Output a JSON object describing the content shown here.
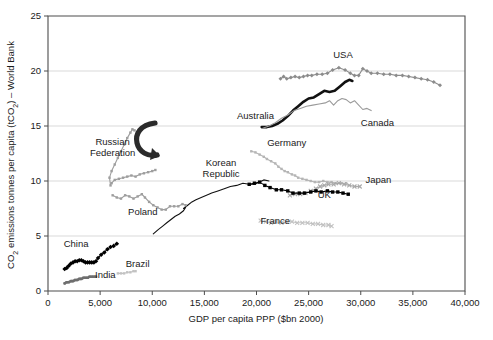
{
  "chart_data": {
    "type": "line",
    "title": "",
    "xlabel": "GDP per capita PPP ($bn 2000)",
    "ylabel": "CO₂ emissions tonnes per capita (tCO₂) – World Bank",
    "xlim": [
      0,
      40000
    ],
    "ylim": [
      0,
      25
    ],
    "xticks": [
      0,
      5000,
      10000,
      15000,
      20000,
      25000,
      30000,
      35000,
      40000
    ],
    "xtick_labels": [
      "0",
      "5,000",
      "10,000",
      "15,000",
      "20,000",
      "25,000",
      "30,000",
      "35,000",
      "40,000"
    ],
    "yticks": [
      0,
      5,
      10,
      15,
      20,
      25
    ],
    "ytick_labels": [
      "0",
      "5",
      "10",
      "15",
      "20",
      "25"
    ],
    "grid": "horizontal",
    "legend_position": "inline-annotations",
    "annotations": [
      {
        "text": "USA",
        "x": 28300,
        "y": 21.2
      },
      {
        "text": "Australia",
        "x": 19900,
        "y": 15.6
      },
      {
        "text": "Canada",
        "x": 31600,
        "y": 15.0
      },
      {
        "text": "Russian\nFederation",
        "x": 6200,
        "y": 13.3
      },
      {
        "text": "Germany",
        "x": 22900,
        "y": 13.2
      },
      {
        "text": "Korean\nRepublic",
        "x": 16600,
        "y": 11.4
      },
      {
        "text": "Japan",
        "x": 31700,
        "y": 9.8
      },
      {
        "text": "UK",
        "x": 26500,
        "y": 8.5
      },
      {
        "text": "Poland",
        "x": 9100,
        "y": 6.9
      },
      {
        "text": "France",
        "x": 21800,
        "y": 6.1
      },
      {
        "text": "China",
        "x": 2700,
        "y": 4.0
      },
      {
        "text": "Brazil",
        "x": 8600,
        "y": 2.2
      },
      {
        "text": "India",
        "x": 5500,
        "y": 1.2
      }
    ],
    "arrow_annotation": {
      "name": "curved-arrow-russian-federation",
      "x": 9400,
      "y": 13.0
    },
    "series": [
      {
        "name": "USA",
        "color": "#8c8c8c",
        "marker": "diamond",
        "style": "line-marker",
        "points": [
          [
            22300,
            19.3
          ],
          [
            22600,
            19.5
          ],
          [
            22900,
            19.3
          ],
          [
            23300,
            19.4
          ],
          [
            23700,
            19.5
          ],
          [
            24100,
            19.4
          ],
          [
            24500,
            19.5
          ],
          [
            24900,
            19.6
          ],
          [
            25300,
            19.6
          ],
          [
            25800,
            19.7
          ],
          [
            26300,
            19.7
          ],
          [
            26800,
            19.8
          ],
          [
            27300,
            20.1
          ],
          [
            27900,
            20.3
          ],
          [
            28500,
            20.1
          ],
          [
            29000,
            19.8
          ],
          [
            29400,
            19.6
          ],
          [
            29800,
            19.6
          ],
          [
            30200,
            20.2
          ],
          [
            30600,
            20.0
          ],
          [
            31000,
            19.8
          ],
          [
            31600,
            19.8
          ],
          [
            32200,
            19.7
          ],
          [
            32800,
            19.7
          ],
          [
            33400,
            19.6
          ],
          [
            34000,
            19.6
          ],
          [
            34600,
            19.5
          ],
          [
            35200,
            19.4
          ],
          [
            35800,
            19.3
          ],
          [
            36400,
            19.2
          ],
          [
            37000,
            19.0
          ],
          [
            37600,
            18.7
          ]
        ]
      },
      {
        "name": "Australia",
        "color": "#111111",
        "marker": "none",
        "style": "thick-line",
        "points": [
          [
            20500,
            14.9
          ],
          [
            21000,
            14.9
          ],
          [
            21500,
            15.0
          ],
          [
            22000,
            15.2
          ],
          [
            22500,
            15.5
          ],
          [
            23000,
            15.9
          ],
          [
            23500,
            16.4
          ],
          [
            24000,
            16.8
          ],
          [
            24500,
            17.2
          ],
          [
            25000,
            17.5
          ],
          [
            25500,
            17.6
          ],
          [
            26000,
            17.9
          ],
          [
            26500,
            18.2
          ],
          [
            27000,
            18.1
          ],
          [
            27500,
            18.2
          ],
          [
            28000,
            18.6
          ],
          [
            28500,
            19.0
          ],
          [
            28900,
            19.2
          ],
          [
            29200,
            19.1
          ]
        ]
      },
      {
        "name": "Canada",
        "color": "#9a9a9a",
        "marker": "none",
        "style": "line",
        "points": [
          [
            20600,
            14.8
          ],
          [
            21200,
            15.0
          ],
          [
            21800,
            15.3
          ],
          [
            22400,
            15.7
          ],
          [
            23000,
            16.0
          ],
          [
            23600,
            16.4
          ],
          [
            24200,
            16.6
          ],
          [
            24800,
            16.8
          ],
          [
            25400,
            16.9
          ],
          [
            26000,
            17.0
          ],
          [
            26600,
            17.1
          ],
          [
            27000,
            17.3
          ],
          [
            27400,
            16.9
          ],
          [
            27800,
            17.3
          ],
          [
            28200,
            17.5
          ],
          [
            28600,
            17.4
          ],
          [
            29000,
            17.1
          ],
          [
            29400,
            17.3
          ],
          [
            29800,
            16.9
          ],
          [
            30200,
            16.5
          ],
          [
            30600,
            16.6
          ],
          [
            31000,
            16.4
          ]
        ]
      },
      {
        "name": "Germany",
        "color": "#b5b5b5",
        "marker": "square",
        "style": "line-marker",
        "points": [
          [
            19500,
            12.7
          ],
          [
            19900,
            12.6
          ],
          [
            20300,
            12.4
          ],
          [
            20700,
            12.2
          ],
          [
            21000,
            12.0
          ],
          [
            21400,
            11.8
          ],
          [
            21800,
            11.6
          ],
          [
            22100,
            11.3
          ],
          [
            22400,
            11.1
          ],
          [
            22700,
            10.9
          ],
          [
            23000,
            10.8
          ],
          [
            23400,
            10.6
          ],
          [
            23700,
            10.5
          ],
          [
            24000,
            10.3
          ],
          [
            24400,
            10.2
          ],
          [
            24800,
            10.1
          ],
          [
            25200,
            10.0
          ],
          [
            25600,
            9.9
          ],
          [
            26000,
            9.9
          ],
          [
            26400,
            10.0
          ],
          [
            26800,
            9.9
          ],
          [
            27200,
            9.9
          ],
          [
            27600,
            9.8
          ],
          [
            28100,
            9.8
          ],
          [
            28600,
            9.8
          ]
        ]
      },
      {
        "name": "Korean Republic",
        "color": "#111111",
        "marker": "none",
        "style": "line",
        "points": [
          [
            10100,
            5.2
          ],
          [
            10600,
            5.6
          ],
          [
            11000,
            5.9
          ],
          [
            11400,
            6.2
          ],
          [
            11800,
            6.5
          ],
          [
            12200,
            6.8
          ],
          [
            12600,
            7.0
          ],
          [
            13000,
            7.3
          ],
          [
            13200,
            7.6
          ],
          [
            13000,
            7.5
          ],
          [
            13400,
            7.8
          ],
          [
            13800,
            8.1
          ],
          [
            14200,
            8.3
          ],
          [
            14700,
            8.5
          ],
          [
            15200,
            8.7
          ],
          [
            15700,
            8.9
          ],
          [
            16300,
            9.1
          ],
          [
            16900,
            9.3
          ],
          [
            17500,
            9.5
          ],
          [
            18100,
            9.6
          ],
          [
            18700,
            9.8
          ],
          [
            19300,
            9.7
          ],
          [
            19800,
            9.7
          ],
          [
            20300,
            9.9
          ],
          [
            20700,
            10.1
          ],
          [
            21200,
            10.0
          ]
        ]
      },
      {
        "name": "Japan",
        "color": "#a8a8a8",
        "marker": "cross",
        "style": "line-marker",
        "points": [
          [
            23200,
            8.7
          ],
          [
            23700,
            8.8
          ],
          [
            24200,
            8.8
          ],
          [
            24700,
            8.9
          ],
          [
            25200,
            9.1
          ],
          [
            25700,
            9.3
          ],
          [
            26100,
            9.5
          ],
          [
            26500,
            9.6
          ],
          [
            26900,
            9.7
          ],
          [
            27400,
            9.7
          ],
          [
            27900,
            9.8
          ],
          [
            28400,
            9.7
          ],
          [
            28900,
            9.6
          ],
          [
            29400,
            9.5
          ],
          [
            29900,
            9.5
          ]
        ]
      },
      {
        "name": "UK",
        "color": "#000000",
        "marker": "square-filled",
        "style": "line-marker",
        "points": [
          [
            19300,
            9.7
          ],
          [
            19800,
            9.8
          ],
          [
            20300,
            9.9
          ],
          [
            20800,
            9.6
          ],
          [
            21300,
            9.4
          ],
          [
            21900,
            9.2
          ],
          [
            22400,
            9.2
          ],
          [
            23000,
            9.1
          ],
          [
            23500,
            8.9
          ],
          [
            24100,
            8.9
          ],
          [
            24600,
            8.9
          ],
          [
            25200,
            9.0
          ],
          [
            25700,
            9.1
          ],
          [
            26200,
            9.0
          ],
          [
            26800,
            9.1
          ],
          [
            27300,
            9.0
          ],
          [
            27800,
            9.0
          ],
          [
            28300,
            8.9
          ],
          [
            28800,
            8.8
          ]
        ]
      },
      {
        "name": "Russian Federation",
        "color": "#9e9e9e",
        "marker": "square",
        "style": "line-marker",
        "points": [
          [
            6000,
            9.6
          ],
          [
            5900,
            10.3
          ],
          [
            6100,
            10.9
          ],
          [
            6400,
            11.5
          ],
          [
            6700,
            12.1
          ],
          [
            7000,
            12.7
          ],
          [
            7300,
            13.3
          ],
          [
            7600,
            13.9
          ],
          [
            7900,
            14.4
          ],
          [
            8100,
            14.7
          ],
          [
            8300,
            14.6
          ]
        ]
      },
      {
        "name": "Poland",
        "color": "#9e9e9e",
        "marker": "square",
        "style": "line-marker",
        "points": [
          [
            6100,
            9.8
          ],
          [
            6400,
            10.1
          ],
          [
            6800,
            10.2
          ],
          [
            7200,
            10.3
          ],
          [
            7600,
            10.4
          ],
          [
            8000,
            10.5
          ],
          [
            8400,
            10.4
          ],
          [
            8800,
            10.6
          ],
          [
            9200,
            10.7
          ],
          [
            9600,
            10.8
          ],
          [
            10000,
            10.9
          ],
          [
            10300,
            11.0
          ]
        ]
      },
      {
        "name": "Poland-lower",
        "color": "#9e9e9e",
        "marker": "square",
        "style": "line-marker",
        "points": [
          [
            6200,
            8.7
          ],
          [
            6600,
            8.5
          ],
          [
            7000,
            8.4
          ],
          [
            7400,
            8.7
          ],
          [
            7800,
            8.6
          ],
          [
            8200,
            8.4
          ],
          [
            8600,
            8.6
          ],
          [
            9000,
            8.8
          ],
          [
            9300,
            8.5
          ],
          [
            9700,
            8.1
          ],
          [
            10100,
            7.8
          ],
          [
            10500,
            7.6
          ],
          [
            10900,
            7.4
          ],
          [
            11300,
            7.4
          ],
          [
            11700,
            7.7
          ],
          [
            12100,
            7.7
          ],
          [
            12500,
            7.7
          ],
          [
            12900,
            7.9
          ],
          [
            13200,
            7.8
          ]
        ]
      },
      {
        "name": "France",
        "color": "#c2c2c2",
        "marker": "cross",
        "style": "line-marker",
        "points": [
          [
            20400,
            6.4
          ],
          [
            20900,
            6.3
          ],
          [
            21400,
            6.2
          ],
          [
            21900,
            6.3
          ],
          [
            22400,
            6.2
          ],
          [
            22900,
            6.3
          ],
          [
            23400,
            6.3
          ],
          [
            23900,
            6.2
          ],
          [
            24400,
            6.2
          ],
          [
            24900,
            6.2
          ],
          [
            25400,
            6.1
          ],
          [
            25900,
            6.1
          ],
          [
            26400,
            6.0
          ],
          [
            26900,
            6.0
          ],
          [
            27200,
            5.9
          ]
        ]
      },
      {
        "name": "China",
        "color": "#000000",
        "marker": "diamond-filled",
        "style": "line-marker",
        "points": [
          [
            1600,
            2.0
          ],
          [
            1800,
            2.1
          ],
          [
            2000,
            2.3
          ],
          [
            2200,
            2.5
          ],
          [
            2400,
            2.6
          ],
          [
            2600,
            2.7
          ],
          [
            2800,
            2.7
          ],
          [
            3000,
            2.8
          ],
          [
            3200,
            2.8
          ],
          [
            3400,
            2.7
          ],
          [
            3600,
            2.6
          ],
          [
            3800,
            2.6
          ],
          [
            4000,
            2.6
          ],
          [
            4200,
            2.6
          ],
          [
            4400,
            2.6
          ],
          [
            4600,
            2.7
          ],
          [
            4800,
            3.0
          ],
          [
            5100,
            3.3
          ],
          [
            5400,
            3.5
          ],
          [
            5700,
            3.8
          ],
          [
            6000,
            4.0
          ],
          [
            6300,
            4.1
          ],
          [
            6600,
            4.3
          ]
        ]
      },
      {
        "name": "India",
        "color": "#6e6e6e",
        "marker": "square",
        "style": "thick-line",
        "points": [
          [
            1600,
            0.7
          ],
          [
            1800,
            0.8
          ],
          [
            2000,
            0.8
          ],
          [
            2200,
            0.9
          ],
          [
            2400,
            0.9
          ],
          [
            2600,
            1.0
          ],
          [
            2800,
            1.0
          ],
          [
            3000,
            1.1
          ],
          [
            3200,
            1.1
          ],
          [
            3400,
            1.2
          ],
          [
            3600,
            1.2
          ],
          [
            3800,
            1.2
          ],
          [
            4000,
            1.3
          ],
          [
            4200,
            1.3
          ],
          [
            4400,
            1.3
          ],
          [
            4600,
            1.3
          ]
        ]
      },
      {
        "name": "Brazil",
        "color": "#c2c2c2",
        "marker": "square",
        "style": "line-marker",
        "points": [
          [
            6700,
            1.6
          ],
          [
            7000,
            1.6
          ],
          [
            7300,
            1.6
          ],
          [
            7600,
            1.7
          ],
          [
            7900,
            1.7
          ],
          [
            8200,
            1.8
          ],
          [
            8400,
            1.8
          ]
        ]
      }
    ]
  }
}
